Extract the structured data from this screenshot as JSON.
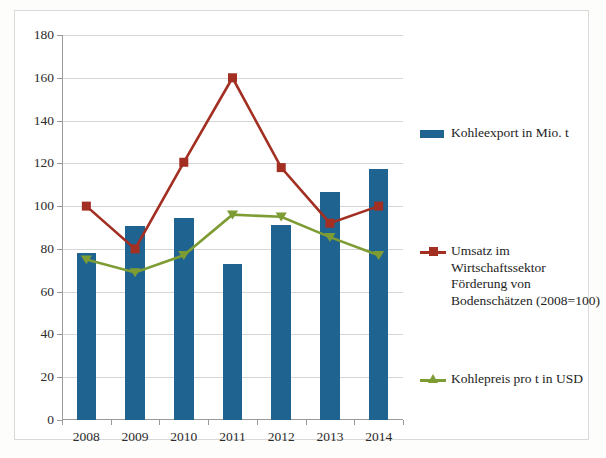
{
  "chart_data": {
    "type": "bar",
    "title": "",
    "subtitle": "",
    "xlabel": "",
    "ylabel": "",
    "categories": [
      "2008",
      "2009",
      "2010",
      "2011",
      "2012",
      "2013",
      "2014"
    ],
    "ylim": [
      0,
      180
    ],
    "ytick_values": [
      0,
      20,
      40,
      60,
      80,
      100,
      120,
      140,
      160,
      180
    ],
    "ytick_labels": [
      "0",
      "20",
      "40",
      "60",
      "80",
      "100",
      "120",
      "140",
      "160",
      "180"
    ],
    "grid": true,
    "legend_position": "right",
    "series": [
      {
        "name": "Kohleexport in Mio. t",
        "type": "bar",
        "color": "#1f6391",
        "values": [
          78,
          90.5,
          94.5,
          73,
          91,
          106.5,
          117.5
        ]
      },
      {
        "name": "Umsatz im Wirtschaftssektor Förderung von Bodenschätzen (2008=100)",
        "type": "line",
        "marker": "square",
        "color": "#a22f22",
        "values": [
          100,
          80,
          120.5,
          160,
          118,
          92,
          100
        ]
      },
      {
        "name": "Kohlepreis pro t in USD",
        "type": "line",
        "marker": "triangle",
        "color": "#7d9c33",
        "values": [
          75,
          69,
          77,
          96,
          95,
          85.5,
          77
        ]
      }
    ]
  },
  "legend": {
    "entries": [
      {
        "label": "Kohleexport in Mio. t",
        "key": "bar-swatch",
        "color": "#1f6391"
      },
      {
        "label": "Umsatz im Wirtschaftssektor",
        "label2": "Förderung von",
        "label3": "Bodenschätzen (2008=100)",
        "key": "line-square-marker",
        "color": "#a22f22"
      },
      {
        "label": "Kohlepreis pro t in USD",
        "key": "line-triangle-marker",
        "color": "#7d9c33"
      }
    ]
  }
}
